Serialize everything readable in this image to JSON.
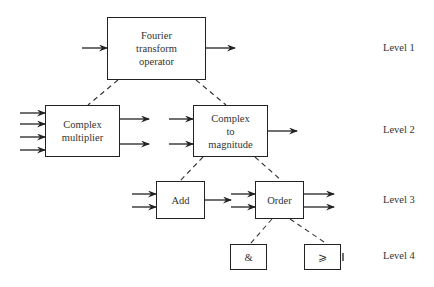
{
  "diagram": {
    "type": "hierarchy",
    "nodes": [
      {
        "id": "fourier",
        "label": "Fourier\ntransform\noperator",
        "level": 1,
        "inputs": 1,
        "outputs": 1
      },
      {
        "id": "complex_multiplier",
        "label": "Complex\nmultiplier",
        "level": 2,
        "inputs": 4,
        "outputs": 2
      },
      {
        "id": "complex_to_magnitude",
        "label": "Complex\nto\nmagnitude",
        "level": 2,
        "inputs": 2,
        "outputs": 1
      },
      {
        "id": "add",
        "label": "Add",
        "level": 3,
        "inputs": 2,
        "outputs": 1
      },
      {
        "id": "order",
        "label": "Order",
        "level": 3,
        "inputs": 2,
        "outputs": 2
      },
      {
        "id": "and",
        "label": "&",
        "level": 4
      },
      {
        "id": "geq",
        "label": "⩾",
        "level": 4
      }
    ],
    "edges_dashed": [
      [
        "fourier",
        "complex_multiplier"
      ],
      [
        "fourier",
        "complex_to_magnitude"
      ],
      [
        "complex_to_magnitude",
        "add"
      ],
      [
        "complex_to_magnitude",
        "order"
      ],
      [
        "order",
        "and"
      ],
      [
        "order",
        "geq"
      ]
    ],
    "levels": [
      "Level 1",
      "Level 2",
      "Level 3",
      "Level 4"
    ]
  },
  "labels": {
    "fourier": "Fourier\ntransform\noperator",
    "complex_multiplier": "Complex\nmultiplier",
    "complex_to_magnitude": "Complex\nto\nmagnitude",
    "add": "Add",
    "order": "Order",
    "and": "&",
    "geq": "⩾",
    "level1": "Level 1",
    "level2": "Level 2",
    "level3": "Level 3",
    "level4": "Level 4"
  }
}
